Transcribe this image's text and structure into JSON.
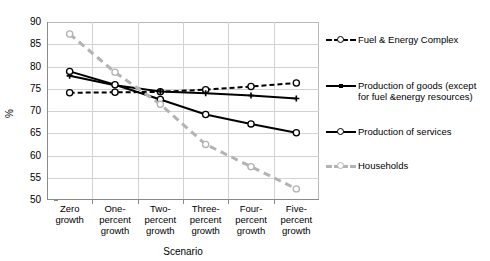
{
  "chart_data": {
    "type": "line",
    "title": "",
    "xlabel": "Scenario",
    "ylabel": "%",
    "categories": [
      "Zero\ngrowth",
      "One-\npercent\ngrowth",
      "Two-\npercent\ngrowth",
      "Three-\npercent\ngrowth",
      "Four-\npercent\ngrowth",
      "Five-\npercent\ngrowth"
    ],
    "ylim": [
      50,
      90
    ],
    "yticks": [
      50,
      55,
      60,
      65,
      70,
      75,
      80,
      85,
      90
    ],
    "grid": true,
    "legend_position": "right",
    "series": [
      {
        "name": "Fuel & Energy Complex",
        "color": "#000000",
        "style": "dashed",
        "marker": "open-circle",
        "values": [
          74.1,
          74.2,
          74.3,
          74.8,
          75.5,
          76.3
        ]
      },
      {
        "name": "Production of goods (except\nfor fuel &energy resources)",
        "color": "#000000",
        "style": "solid",
        "marker": "plus",
        "values": [
          77.9,
          75.8,
          74.4,
          74.0,
          73.5,
          72.8
        ]
      },
      {
        "name": "Production of services",
        "color": "#000000",
        "style": "solid",
        "marker": "open-circle",
        "values": [
          78.9,
          75.9,
          72.6,
          69.2,
          67.1,
          65.1
        ]
      },
      {
        "name": "Households",
        "color": "#b3b3b3",
        "style": "dashed",
        "marker": "open-circle",
        "values": [
          87.3,
          78.7,
          71.5,
          62.5,
          57.5,
          52.5
        ]
      }
    ]
  }
}
